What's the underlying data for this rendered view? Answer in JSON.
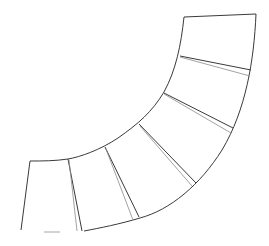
{
  "diagram": {
    "stroke_color": "#3a3a3a",
    "secondary_stroke_color": "#8a8a8a",
    "background": "#ffffff",
    "segments": 5,
    "labels": []
  }
}
